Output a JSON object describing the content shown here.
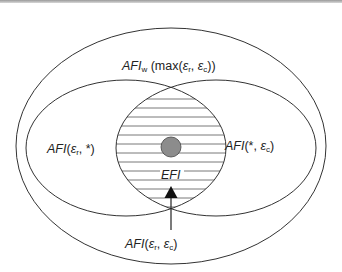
{
  "diagram": {
    "type": "nested-venn",
    "outer_set": {
      "label_main": "AFI",
      "label_sub": "w",
      "label_rest": " (max(",
      "eps_r": "ε",
      "r": "r",
      "sep": ", ",
      "eps_c": "ε",
      "c": "c",
      "close": "))"
    },
    "left_set": {
      "label_main": "AFI",
      "open": "(",
      "eps": "ε",
      "sub": "r",
      "rest": ", *)"
    },
    "right_set": {
      "label_main": "AFI",
      "open": "(*, ",
      "eps": "ε",
      "sub": "c",
      "close": ")"
    },
    "intersection": {
      "label": "EFI",
      "fill": "horizontal-hatch"
    },
    "pointer": {
      "label_main": "AFI",
      "open": "(",
      "eps_r": "ε",
      "r": "r",
      "sep": ", ",
      "eps_c": "ε",
      "c": "c",
      "close": ")"
    },
    "point_marker": {
      "color": "#8c8c8c"
    }
  },
  "colors": {
    "stroke": "#333333",
    "hatch": "#444444",
    "dot": "#8c8c8c"
  }
}
